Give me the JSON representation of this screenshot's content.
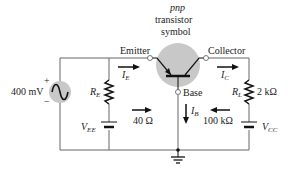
{
  "title": {
    "line1": "pnp",
    "line2": "transistor",
    "line3": "symbol"
  },
  "terminals": {
    "emitter": "Emitter",
    "collector": "Collector",
    "base": "Base"
  },
  "source": {
    "value": "400 mV",
    "plus": "+",
    "minus": "−"
  },
  "components": {
    "re": {
      "symbol": "R",
      "sub": "E"
    },
    "vee": {
      "symbol": "V",
      "sub": "EE"
    },
    "rl": {
      "symbol": "R",
      "sub": "L",
      "value": "2 kΩ"
    },
    "vcc": {
      "symbol": "V",
      "sub": "CC"
    }
  },
  "currents": {
    "ie": {
      "symbol": "I",
      "sub": "E"
    },
    "ic": {
      "symbol": "I",
      "sub": "C"
    },
    "ib": {
      "symbol": "I",
      "sub": "B"
    }
  },
  "impedances": {
    "input": "40 Ω",
    "output": "100 kΩ"
  },
  "colors": {
    "wire": "#555555",
    "circle": "#c8c8c8",
    "ink": "#111111"
  }
}
